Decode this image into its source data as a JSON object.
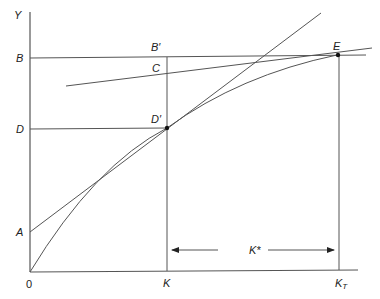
{
  "diagram": {
    "axes": {
      "y_label": "Y",
      "origin_label": "0"
    },
    "y_labels": {
      "B": "B",
      "D": "D",
      "A": "A"
    },
    "x_labels": {
      "K": "K",
      "K_T": "K",
      "K_T_sub": "T"
    },
    "point_labels": {
      "B_prime": "B′",
      "C": "C",
      "D_prime": "D′",
      "E": "E"
    },
    "arrow_label": "K*",
    "colors": {
      "line": "#555555",
      "text": "#222222",
      "point": "#111111"
    }
  }
}
